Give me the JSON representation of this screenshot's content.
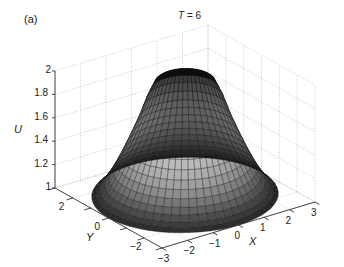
{
  "figure": {
    "panel_label": "(a)",
    "title_var": "T",
    "title_value": " = 6"
  },
  "chart_data": {
    "type": "surface3d",
    "title": "T = 6",
    "panel": "(a)",
    "xlabel": "X",
    "ylabel": "Y",
    "zlabel": "U",
    "xlim": [
      -3,
      3
    ],
    "ylim": [
      -3,
      3
    ],
    "zlim": [
      1,
      2
    ],
    "xticks": [
      -3,
      -2,
      -1,
      0,
      1,
      2,
      3
    ],
    "yticks": [
      -2,
      0,
      2
    ],
    "zticks": [
      1,
      1.2,
      1.4,
      1.6,
      1.8,
      2
    ],
    "xtick_labels": [
      "−3",
      "−2",
      "−1",
      "0",
      "1",
      "2",
      "3"
    ],
    "ytick_labels": [
      "−2",
      "0",
      "2"
    ],
    "ztick_labels": [
      "1",
      "1.2",
      "1.4",
      "1.6",
      "1.8",
      "2"
    ],
    "grid": true,
    "colormap": "gray",
    "shape": "axisymmetric bell/volcano surface over a disk of radius ~3; U rises from ~1 at the rim to ~2 at the top rim near r≈0.9 with a slight central dip",
    "profile": {
      "r": [
        0.0,
        0.5,
        0.9,
        1.2,
        1.5,
        1.8,
        2.1,
        2.4,
        2.7,
        3.0
      ],
      "U": [
        1.95,
        1.97,
        2.0,
        1.85,
        1.65,
        1.48,
        1.32,
        1.18,
        1.07,
        1.0
      ]
    }
  }
}
